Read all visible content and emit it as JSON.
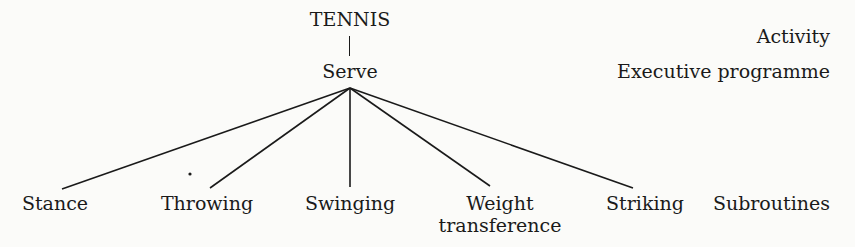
{
  "diagram": {
    "root": "TENNIS",
    "program": "Serve",
    "subroutines": [
      {
        "label": "Stance",
        "lines": [
          "Stance"
        ]
      },
      {
        "label": "Throwing",
        "lines": [
          "Throwing"
        ]
      },
      {
        "label": "Swinging",
        "lines": [
          "Swinging"
        ]
      },
      {
        "label": "Weight transference",
        "lines": [
          "Weight",
          "transference"
        ]
      },
      {
        "label": "Striking",
        "lines": [
          "Striking"
        ]
      }
    ],
    "level_labels": {
      "activity": "Activity",
      "executive": "Executive programme",
      "subroutines": "Subroutines"
    }
  }
}
